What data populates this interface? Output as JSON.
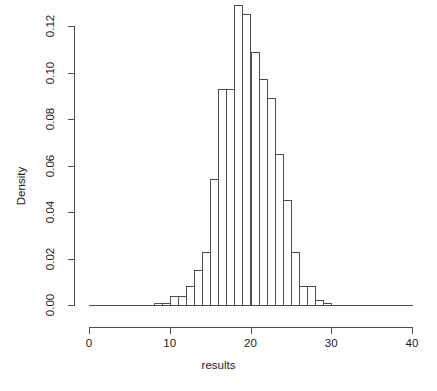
{
  "chart_data": {
    "type": "bar",
    "title": "",
    "subtitle": "",
    "xlabel": "results",
    "ylabel": "Density",
    "xlim": [
      0,
      40
    ],
    "ylim": [
      0.0,
      0.13
    ],
    "grid": false,
    "legend": null,
    "xticks": [
      0,
      10,
      20,
      30,
      40
    ],
    "xtick_labels": [
      "0",
      "10",
      "20",
      "30",
      "40"
    ],
    "yticks": [
      0.0,
      0.02,
      0.04,
      0.06,
      0.08,
      0.1,
      0.12
    ],
    "ytick_labels": [
      "0.00",
      "0.02",
      "0.04",
      "0.06",
      "0.08",
      "0.10",
      "0.12"
    ],
    "bin_width": 1,
    "bins": [
      {
        "x0": 8,
        "x1": 9,
        "value": 0.001
      },
      {
        "x0": 9,
        "x1": 10,
        "value": 0.001
      },
      {
        "x0": 10,
        "x1": 11,
        "value": 0.004
      },
      {
        "x0": 11,
        "x1": 12,
        "value": 0.004
      },
      {
        "x0": 12,
        "x1": 13,
        "value": 0.008
      },
      {
        "x0": 13,
        "x1": 14,
        "value": 0.015
      },
      {
        "x0": 14,
        "x1": 15,
        "value": 0.023
      },
      {
        "x0": 15,
        "x1": 16,
        "value": 0.054
      },
      {
        "x0": 16,
        "x1": 17,
        "value": 0.093
      },
      {
        "x0": 17,
        "x1": 18,
        "value": 0.093
      },
      {
        "x0": 18,
        "x1": 19,
        "value": 0.129
      },
      {
        "x0": 19,
        "x1": 20,
        "value": 0.125
      },
      {
        "x0": 20,
        "x1": 21,
        "value": 0.109
      },
      {
        "x0": 21,
        "x1": 22,
        "value": 0.097
      },
      {
        "x0": 22,
        "x1": 23,
        "value": 0.089
      },
      {
        "x0": 23,
        "x1": 24,
        "value": 0.065
      },
      {
        "x0": 24,
        "x1": 25,
        "value": 0.045
      },
      {
        "x0": 25,
        "x1": 26,
        "value": 0.023
      },
      {
        "x0": 26,
        "x1": 27,
        "value": 0.008
      },
      {
        "x0": 27,
        "x1": 28,
        "value": 0.008
      },
      {
        "x0": 28,
        "x1": 29,
        "value": 0.002
      },
      {
        "x0": 29,
        "x1": 30,
        "value": 0.001
      }
    ],
    "colors": {
      "bar_border": "#4d4d4d",
      "bar_fill": "transparent",
      "axis": "#4d4d4d",
      "text": "#1a1a1a",
      "background": "#ffffff"
    }
  },
  "axis_geometry": {
    "x_px_at_0": 89,
    "x_px_per_unit": 8.075,
    "y_px_at_0": 305,
    "y_px_per_density": 2325
  }
}
